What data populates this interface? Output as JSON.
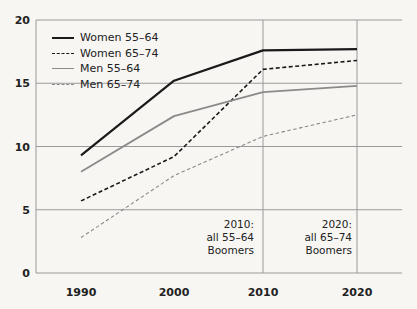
{
  "chart_data": {
    "type": "line",
    "title": "",
    "xlabel": "",
    "ylabel": "",
    "x": [
      1990,
      2000,
      2010,
      2020
    ],
    "xticks": [
      "1990",
      "2000",
      "2010",
      "2020"
    ],
    "yticks": [
      "0",
      "5",
      "10",
      "15",
      "20"
    ],
    "ylim": [
      0,
      20
    ],
    "grid": {
      "horizontal": true,
      "vertical_at": [
        2010,
        2020
      ]
    },
    "legend_position": "upper-left",
    "series": [
      {
        "name": "Women 55–64",
        "values": [
          9.3,
          15.2,
          17.6,
          17.7
        ],
        "style": "solid",
        "color": "#1a1a1a",
        "width": 2.2
      },
      {
        "name": "Women 65–74",
        "values": [
          5.7,
          9.2,
          16.1,
          16.8
        ],
        "style": "dashed",
        "color": "#1a1a1a",
        "width": 1.6
      },
      {
        "name": "Men 55–64",
        "values": [
          8.0,
          12.4,
          14.3,
          14.8
        ],
        "style": "solid",
        "color": "#8a8a8a",
        "width": 1.8
      },
      {
        "name": "Men 65–74",
        "values": [
          2.8,
          7.7,
          10.8,
          12.5
        ],
        "style": "dashed",
        "color": "#8a8a8a",
        "width": 1.1
      }
    ],
    "annotations": [
      {
        "x": 2010,
        "lines": [
          "2010:",
          "all 55–64",
          "Boomers"
        ]
      },
      {
        "x": 2020,
        "lines": [
          "2020:",
          "all 65–74",
          "Boomers"
        ]
      }
    ]
  },
  "colors": {
    "grid": "#9a9a9a",
    "background": "#f7f6f3",
    "text": "#222222"
  }
}
